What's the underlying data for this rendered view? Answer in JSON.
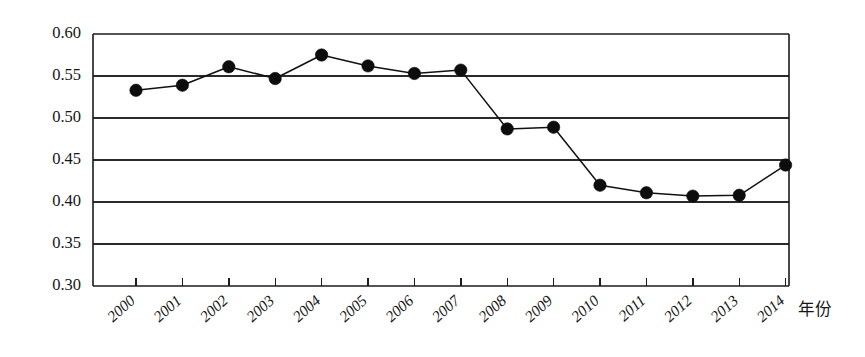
{
  "chart_data": {
    "type": "line",
    "title": "",
    "xlabel": "年份",
    "ylabel": "",
    "categories": [
      "2000",
      "2001",
      "2002",
      "2003",
      "2004",
      "2005",
      "2006",
      "2007",
      "2008",
      "2009",
      "2010",
      "2011",
      "2012",
      "2013",
      "2014"
    ],
    "values": [
      0.533,
      0.539,
      0.561,
      0.547,
      0.575,
      0.562,
      0.553,
      0.557,
      0.487,
      0.489,
      0.42,
      0.411,
      0.407,
      0.408,
      0.444
    ],
    "series": [
      {
        "name": "",
        "values": [
          0.533,
          0.539,
          0.561,
          0.547,
          0.575,
          0.562,
          0.553,
          0.557,
          0.487,
          0.489,
          0.42,
          0.411,
          0.407,
          0.408,
          0.444
        ]
      }
    ],
    "ylim": [
      0.3,
      0.6
    ],
    "yticks": [
      0.3,
      0.35,
      0.4,
      0.45,
      0.5,
      0.55,
      0.6
    ],
    "ytick_labels": [
      "0.30",
      "0.35",
      "0.40",
      "0.45",
      "0.50",
      "0.55",
      "0.60"
    ],
    "xtick_labels": [
      "2000",
      "2001",
      "2002",
      "2003",
      "2004",
      "2005",
      "2006",
      "2007",
      "2008",
      "2009",
      "2010",
      "2011",
      "2012",
      "2013",
      "2014"
    ],
    "grid": "horizontal",
    "legend": "none",
    "marker": "filled-circle",
    "line_color": "#111111",
    "marker_color": "#0d0d0d",
    "grid_color": "#2a2a2a",
    "axis_color": "#1c1c1c",
    "background": "#ffffff",
    "annotations": []
  },
  "layout": {
    "plot_left": 93,
    "plot_right": 789,
    "plot_top": 34,
    "plot_bottom": 286,
    "x_first_tick": 136,
    "x_tick_step": 46.4,
    "xlabel_x": 798,
    "xlabel_y": 311
  }
}
